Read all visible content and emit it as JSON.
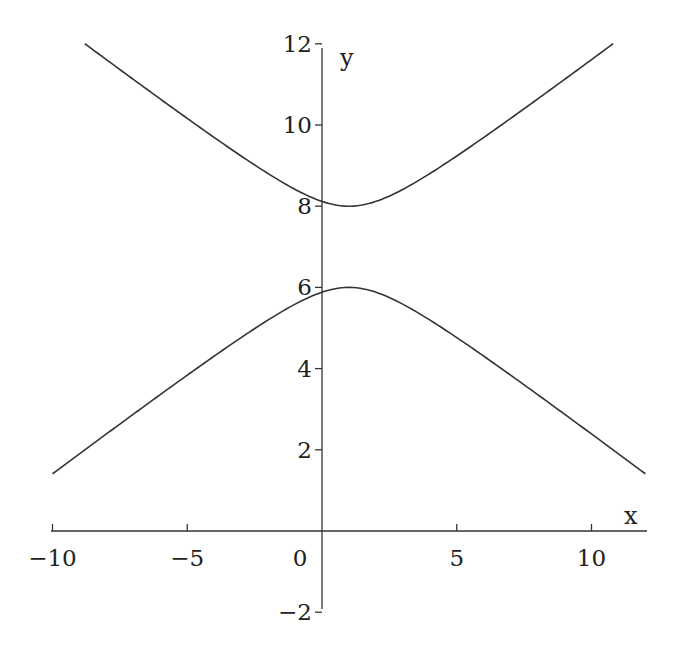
{
  "chart_data": {
    "type": "line",
    "title": "",
    "xlabel": "x",
    "ylabel": "y",
    "xlim": [
      -10,
      12
    ],
    "ylim": [
      -2,
      12
    ],
    "grid": false,
    "legend": null,
    "x_ticks": [
      -10,
      -5,
      0,
      5,
      10
    ],
    "x_tick_labels": [
      "−10",
      "−5",
      "0",
      "5",
      "10"
    ],
    "y_ticks": [
      -2,
      2,
      4,
      6,
      8,
      10,
      12
    ],
    "y_tick_labels": [
      "−2",
      "2",
      "4",
      "6",
      "8",
      "10",
      "12"
    ],
    "equation": "(y-7)^2 - (x-1)^2/4 = 1",
    "series": [
      {
        "name": "upper branch",
        "x": [
          -8.8,
          -8,
          -6,
          -4,
          -2,
          0,
          1,
          2,
          4,
          6,
          8,
          10,
          10.8
        ],
        "y": [
          12.0,
          11.61,
          10.64,
          9.69,
          8.8,
          8.12,
          8.0,
          8.12,
          8.8,
          9.69,
          10.64,
          11.61,
          12.0
        ]
      },
      {
        "name": "lower branch",
        "x": [
          -10,
          -9,
          -8,
          -6,
          -4,
          -2,
          0,
          1,
          2,
          4,
          6,
          8,
          10,
          11,
          12
        ],
        "y": [
          1.41,
          1.9,
          2.39,
          3.36,
          4.31,
          5.2,
          5.88,
          6.0,
          5.88,
          5.2,
          4.31,
          3.36,
          2.39,
          1.9,
          1.41
        ]
      }
    ]
  }
}
